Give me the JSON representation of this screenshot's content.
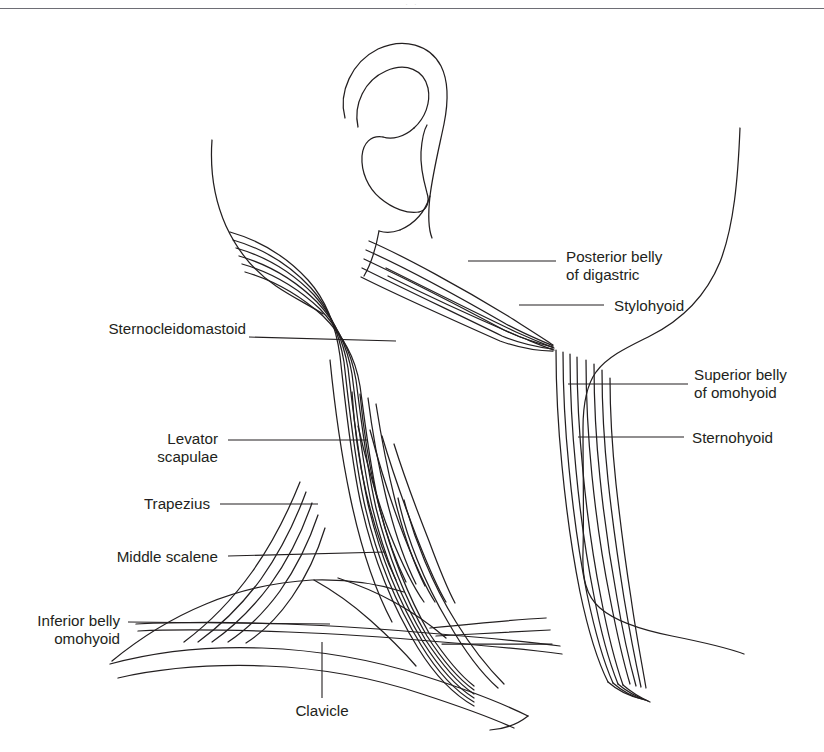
{
  "page": {
    "background_color": "#ffffff",
    "line_color": "#231f20",
    "rule_color": "#6e6e75",
    "faint_header_text": "· ·"
  },
  "labels": {
    "sternocleidomastoid": "Sternocleidomastoid",
    "levator_scapulae_line1": "Levator",
    "levator_scapulae_line2": "scapulae",
    "trapezius": "Trapezius",
    "middle_scalene": "Middle scalene",
    "inferior_belly_line1": "Inferior belly",
    "inferior_belly_line2": "omohyoid",
    "clavicle": "Clavicle",
    "posterior_belly_line1": "Posterior belly",
    "posterior_belly_line2": "of digastric",
    "stylohyoid": "Stylohyoid",
    "superior_belly_line1": "Superior belly",
    "superior_belly_line2": "of omohyoid",
    "sternohyoid": "Sternohyoid"
  },
  "structures": [
    {
      "name": "ear",
      "label": null
    },
    {
      "name": "sternocleidomastoid",
      "label": "Sternocleidomastoid"
    },
    {
      "name": "levator-scapulae",
      "label": "Levator scapulae"
    },
    {
      "name": "trapezius",
      "label": "Trapezius"
    },
    {
      "name": "middle-scalene",
      "label": "Middle scalene"
    },
    {
      "name": "inferior-belly-omohyoid",
      "label": "Inferior belly omohyoid"
    },
    {
      "name": "clavicle",
      "label": "Clavicle"
    },
    {
      "name": "posterior-belly-digastric",
      "label": "Posterior belly of digastric"
    },
    {
      "name": "stylohyoid",
      "label": "Stylohyoid"
    },
    {
      "name": "superior-belly-omohyoid",
      "label": "Superior belly of omohyoid"
    },
    {
      "name": "sternohyoid",
      "label": "Sternohyoid"
    }
  ]
}
